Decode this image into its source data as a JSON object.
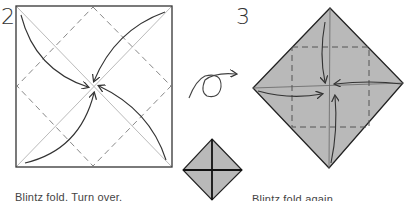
{
  "steps": [
    {
      "number": "2",
      "caption": "Blintz fold. Turn over."
    },
    {
      "number": "3",
      "caption": "Blintz fold again."
    }
  ],
  "icons": {
    "turn_over": "turn-over-arrow-icon"
  },
  "colors": {
    "paper_colored": "#b9b9b9",
    "line": "#333333",
    "crease": "#bbbbbb",
    "dashed": "#888888"
  }
}
